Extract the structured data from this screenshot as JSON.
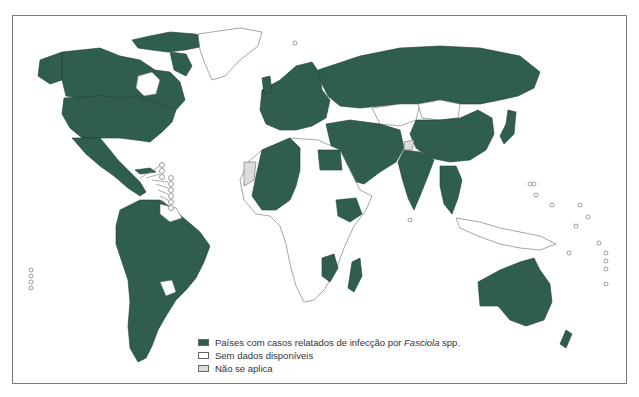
{
  "map": {
    "title": "",
    "colors": {
      "reported": "#2f5e4e",
      "no_data": "#ffffff",
      "not_applicable": "#dcdcdc",
      "border": "#7a7a7a"
    }
  },
  "legend": {
    "items": [
      {
        "key": "reported",
        "label": "Países com casos relatados de infecção por ",
        "label_italic": "Fasciola",
        "label_suffix": " spp.",
        "color": "#2f5e4e"
      },
      {
        "key": "no_data",
        "label": "Sem dados disponíveis",
        "color": "#ffffff"
      },
      {
        "key": "not_applicable",
        "label": "Não se aplica",
        "color": "#dcdcdc"
      }
    ]
  },
  "regions": {
    "reported": [
      "Canada",
      "United States",
      "Mexico",
      "Central America",
      "South America (most)",
      "Europe (most)",
      "Russia",
      "Turkey",
      "Middle East",
      "Iran",
      "Egypt",
      "North-West Africa",
      "Ethiopia",
      "Madagascar",
      "Mozambique",
      "India",
      "China",
      "Southeast Asia",
      "Japan",
      "Korea",
      "Australia",
      "New Zealand"
    ],
    "no_data": [
      "Greenland",
      "Sub-Saharan Africa (most)",
      "Kazakhstan",
      "Mongolia",
      "Indonesia",
      "Papua New Guinea",
      "Pacific islands"
    ],
    "not_applicable": [
      "Western Sahara",
      "Kashmir"
    ]
  }
}
